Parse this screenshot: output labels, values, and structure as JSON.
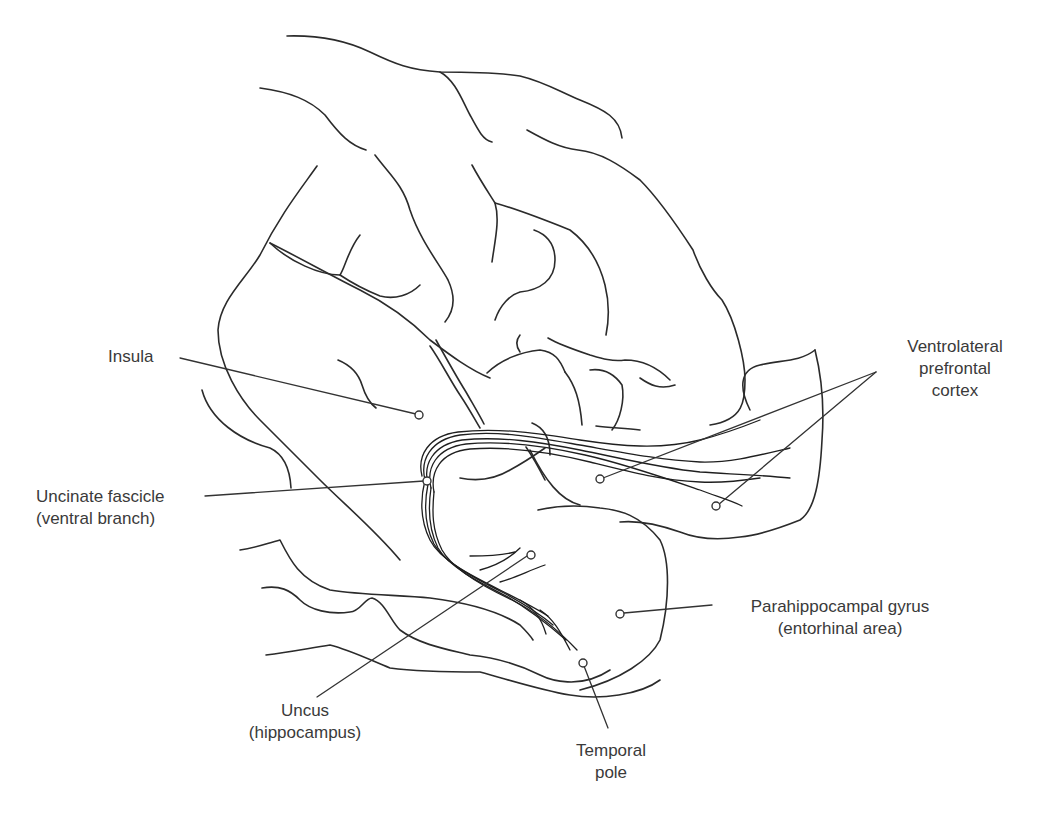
{
  "figure": {
    "line_color": "#2b2b2b",
    "background": "#ffffff"
  },
  "labels": {
    "insula": {
      "line1": "Insula"
    },
    "uncinate": {
      "line1": "Uncinate fascicle",
      "line2": "(ventral branch)"
    },
    "vlpfc": {
      "line1": "Ventrolateral",
      "line2": "prefrontal",
      "line3": "cortex"
    },
    "parahippocampal": {
      "line1": "Parahippocampal gyrus",
      "line2": "(entorhinal area)"
    },
    "uncus": {
      "line1": "Uncus",
      "line2": "(hippocampus)"
    },
    "temporal_pole": {
      "line1": "Temporal",
      "line2": "pole"
    }
  }
}
